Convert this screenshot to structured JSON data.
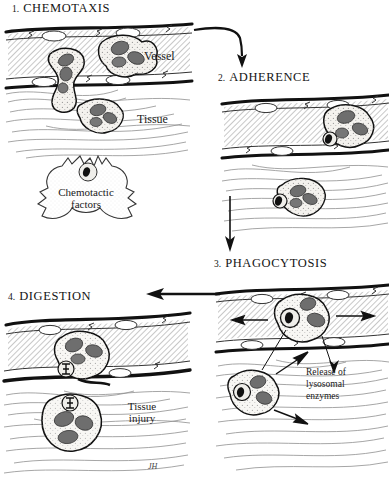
{
  "figure": {
    "title_implicit": "Leukocyte inflammatory response sequence",
    "signature": "JH"
  },
  "panels": [
    {
      "id": "chemotaxis",
      "number": "1.",
      "title": "CHEMOTAXIS",
      "labels": [
        {
          "name": "vessel-label",
          "text": "Vessel"
        },
        {
          "name": "tissue-label",
          "text": "Tissue"
        },
        {
          "name": "chemotactic-factors-label",
          "line1": "Chemotactic",
          "line2": "factors"
        }
      ]
    },
    {
      "id": "adherence",
      "number": "2.",
      "title": "ADHERENCE",
      "labels": []
    },
    {
      "id": "phagocytosis",
      "number": "3.",
      "title": "PHAGOCYTOSIS",
      "labels": [
        {
          "name": "release-enzymes-label",
          "line1": "Release of",
          "line2": "lysosomal",
          "line3": "enzymes"
        }
      ]
    },
    {
      "id": "digestion",
      "number": "4.",
      "title": "DIGESTION",
      "labels": [
        {
          "name": "tissue-injury-label",
          "line1": "Tissue",
          "line2": "injury"
        }
      ]
    }
  ],
  "flow_arrows": [
    {
      "name": "arrow-chemotaxis-to-adherence",
      "direction": "right-then-down"
    },
    {
      "name": "arrow-adherence-to-phagocytosis",
      "direction": "down"
    },
    {
      "name": "arrow-phagocytosis-to-digestion",
      "direction": "left"
    }
  ],
  "colors": {
    "ink": "#141414",
    "nucleus": "#6f6f6f",
    "cytoplasm": "#f2f0ec",
    "vessel_fill": "#d8d6d2",
    "paper": "#ffffff"
  }
}
